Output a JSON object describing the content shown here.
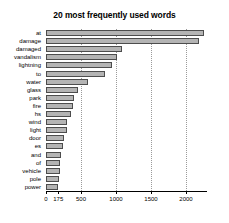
{
  "chart_data": {
    "type": "bar",
    "orientation": "horizontal",
    "title": "20 most frequently used words",
    "xlabel": "",
    "ylabel": "",
    "categories": [
      "at",
      "damage",
      "damaged",
      "vandalism",
      "lightning",
      "to",
      "water",
      "glass",
      "park",
      "fire",
      "hs",
      "wind",
      "light",
      "door",
      "es",
      "and",
      "of",
      "vehicle",
      "pole",
      "power"
    ],
    "values": [
      2250,
      2180,
      1080,
      1010,
      940,
      840,
      600,
      450,
      400,
      385,
      350,
      300,
      295,
      250,
      240,
      215,
      205,
      200,
      190,
      175
    ],
    "xlim": [
      0,
      2300
    ],
    "xticks": [
      0,
      175,
      500,
      1000,
      1500,
      2000
    ],
    "xtick_labels": [
      "0",
      "175",
      "500",
      "1000",
      "1500",
      "2000"
    ],
    "gridlines_x": [
      500,
      1000,
      1500,
      2000
    ],
    "grid": true,
    "legend": false,
    "bar_fill_color": "#b4b4b4",
    "bar_edge_color": "#4d4d4d",
    "grid_color": "#9a9a9a",
    "background_color": "#ffffff",
    "text_color": "#000000"
  }
}
